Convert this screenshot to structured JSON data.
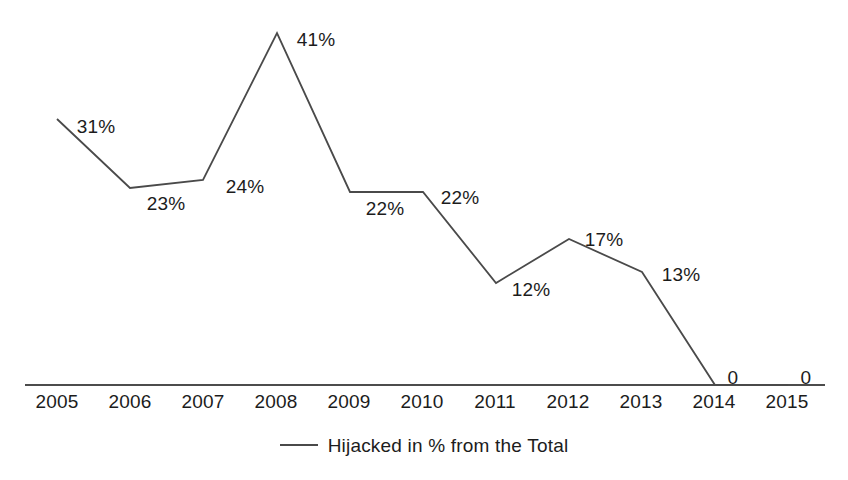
{
  "chart_data": {
    "type": "line",
    "title": "",
    "subtitle": "",
    "xlabel": "",
    "ylabel": "",
    "grid": false,
    "legend_position": "bottom-center",
    "categories": [
      "2005",
      "2006",
      "2007",
      "2008",
      "2009",
      "2010",
      "2011",
      "2012",
      "2013",
      "2014",
      "2015"
    ],
    "ylim": [
      0,
      41
    ],
    "series": [
      {
        "name": "Hijacked in % from the Total",
        "values": [
          31,
          23,
          24,
          41,
          22,
          22,
          12,
          17,
          13,
          0,
          0
        ],
        "point_labels": [
          "31%",
          "23%",
          "24%",
          "41%",
          "22%",
          "22%",
          "12%",
          "17%",
          "13%",
          "0",
          "0"
        ]
      }
    ],
    "legend": [
      "Hijacked in % from the Total"
    ],
    "axis": {
      "x_tick_labels": [
        "2005",
        "2006",
        "2007",
        "2008",
        "2009",
        "2010",
        "2011",
        "2012",
        "2013",
        "2014",
        "2015"
      ],
      "y_axis_visible": false,
      "x_axis_visible": true
    },
    "colors": {
      "series_line": "#4a4a4a",
      "axis": "#4c4c4c",
      "text": "#1c1c1c",
      "background": "#ffffff"
    }
  },
  "geometry": {
    "plot_left": 25,
    "plot_right": 825,
    "baseline_y": 385,
    "first_tick_x": 57,
    "tick_spacing": 73,
    "px_per_percent": 8.585,
    "points": [
      {
        "x": 57,
        "y": 119
      },
      {
        "x": 130,
        "y": 188
      },
      {
        "x": 203,
        "y": 180
      },
      {
        "x": 277,
        "y": 33
      },
      {
        "x": 350,
        "y": 192
      },
      {
        "x": 423,
        "y": 192
      },
      {
        "x": 496,
        "y": 283
      },
      {
        "x": 569,
        "y": 239
      },
      {
        "x": 642,
        "y": 272
      },
      {
        "x": 715,
        "y": 385
      },
      {
        "x": 788,
        "y": 385
      }
    ],
    "label_positions": [
      {
        "x": 96,
        "y": 117
      },
      {
        "x": 166,
        "y": 194
      },
      {
        "x": 245,
        "y": 177
      },
      {
        "x": 316,
        "y": 30
      },
      {
        "x": 385,
        "y": 199
      },
      {
        "x": 460,
        "y": 188
      },
      {
        "x": 531,
        "y": 280
      },
      {
        "x": 604,
        "y": 230
      },
      {
        "x": 681,
        "y": 265
      },
      {
        "x": 733,
        "y": 368
      },
      {
        "x": 806,
        "y": 368
      }
    ],
    "tick_label_y": 392
  }
}
